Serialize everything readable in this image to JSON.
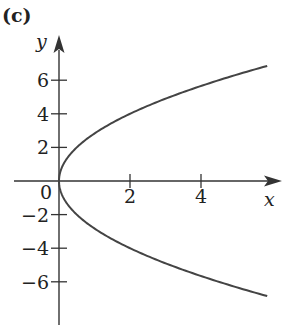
{
  "panel_label": "(c)",
  "chart_data": {
    "type": "line",
    "title": "",
    "equation_hint": "x = y^2/8 (parabola opening right)",
    "xlabel": "x",
    "ylabel": "y",
    "xlim": [
      -0.6,
      6.3
    ],
    "ylim": [
      -8.4,
      8.4
    ],
    "x_ticks": [
      2,
      4
    ],
    "y_ticks": [
      -6,
      -4,
      -2,
      2,
      4,
      6
    ],
    "origin_label": "0",
    "grid": false,
    "series": [
      {
        "name": "parabola",
        "color": "#444444",
        "points": [
          {
            "x": 5.87,
            "y": 6.85
          },
          {
            "x": 4.5,
            "y": 6.0
          },
          {
            "x": 3.125,
            "y": 5.0
          },
          {
            "x": 2.0,
            "y": 4.0
          },
          {
            "x": 1.125,
            "y": 3.0
          },
          {
            "x": 0.5,
            "y": 2.0
          },
          {
            "x": 0.125,
            "y": 1.0
          },
          {
            "x": 0.0,
            "y": 0.0
          },
          {
            "x": 0.125,
            "y": -1.0
          },
          {
            "x": 0.5,
            "y": -2.0
          },
          {
            "x": 1.125,
            "y": -3.0
          },
          {
            "x": 2.0,
            "y": -4.0
          },
          {
            "x": 3.125,
            "y": -5.0
          },
          {
            "x": 4.5,
            "y": -6.0
          },
          {
            "x": 5.87,
            "y": -6.85
          }
        ]
      }
    ]
  },
  "layout": {
    "origin_px": [
      59,
      181
    ],
    "px_per_x": 35.5,
    "px_per_y": 16.8,
    "axis_color": "#333333"
  }
}
